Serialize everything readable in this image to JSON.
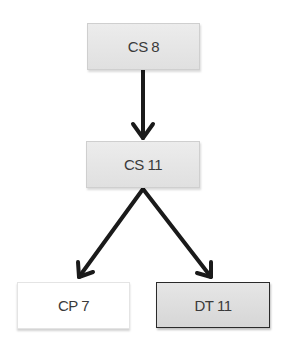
{
  "diagram": {
    "nodes": [
      {
        "id": "cs8",
        "label": "CS 8"
      },
      {
        "id": "cs11",
        "label": "CS 11"
      },
      {
        "id": "cp7",
        "label": "CP 7"
      },
      {
        "id": "dt11",
        "label": "DT 11"
      }
    ],
    "edges": [
      {
        "from": "cs8",
        "to": "cs11"
      },
      {
        "from": "cs11",
        "to": "cp7"
      },
      {
        "from": "cs11",
        "to": "dt11"
      }
    ],
    "colors": {
      "arrow": "#1a1a1a",
      "node_fill": "#e6e6e6",
      "highlight_border": "#2a2a2a"
    }
  }
}
